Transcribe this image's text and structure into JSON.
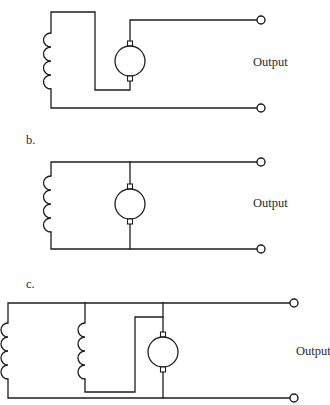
{
  "figure": {
    "diagrams": [
      {
        "id": "a",
        "label": "",
        "output_label": "Output",
        "description": "series-connected field coil with DC armature",
        "components": [
          "inductor-coil",
          "dc-armature",
          "output-terminal",
          "output-terminal"
        ]
      },
      {
        "id": "b",
        "label": "b.",
        "output_label": "Output",
        "description": "shunt-connected field coil in parallel with DC armature",
        "components": [
          "inductor-coil",
          "dc-armature",
          "output-terminal",
          "output-terminal"
        ]
      },
      {
        "id": "c",
        "label": "c.",
        "output_label": "Output",
        "description": "compound connection: shunt field coil plus second field coil feeding DC armature",
        "components": [
          "inductor-coil",
          "inductor-coil",
          "dc-armature",
          "output-terminal",
          "output-terminal"
        ]
      }
    ],
    "colors": {
      "line": "#1e1e1e",
      "text": "#2a2a2a",
      "background": "#ffffff"
    }
  }
}
